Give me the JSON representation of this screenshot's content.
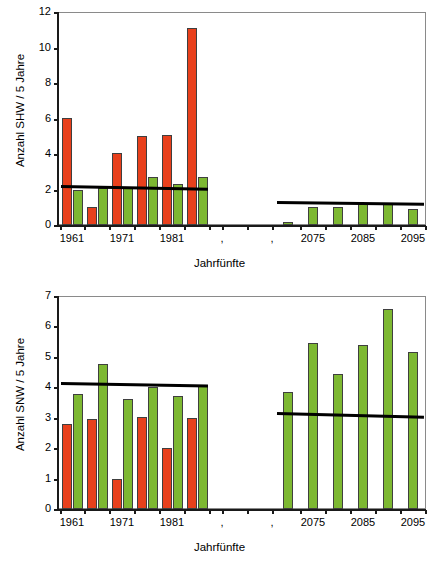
{
  "figure": {
    "width": 439,
    "height": 568,
    "colors": {
      "bar_observed": "#e8401c",
      "bar_modelled": "#7db832",
      "trend_line": "#000000",
      "axis": "#1a1a1a",
      "frame": "#8a8a8a",
      "background": "#ffffff"
    }
  },
  "chart_data": [
    {
      "type": "bar",
      "id": "shw-chart",
      "title": "",
      "xlabel": "Jahrfünfte",
      "ylabel": "Anzahl SHW / 5 Jahre",
      "ylim": [
        0,
        12
      ],
      "yticks": [
        0,
        2,
        4,
        6,
        8,
        10,
        12
      ],
      "ytick_labels": [
        "0",
        "2",
        "4",
        "6",
        "8",
        "10",
        "12"
      ],
      "grid": false,
      "legend": "none",
      "xtick_labels": [
        "1961",
        "1971",
        "1981",
        ",",
        ",",
        "2075",
        "2085",
        "2095"
      ],
      "categories": [
        "1961",
        "1966",
        "1971",
        "1976",
        "1981",
        "1986",
        "2070",
        "2075",
        "2080",
        "2085",
        "2090",
        "2095"
      ],
      "series": [
        {
          "name": "beobachtet",
          "color": "#e8401c",
          "values": [
            6.05,
            1.0,
            4.05,
            5.0,
            5.05,
            11.1,
            null,
            null,
            null,
            null,
            null,
            null
          ]
        },
        {
          "name": "modelliert",
          "color": "#7db832",
          "values": [
            2.0,
            2.1,
            2.15,
            2.7,
            2.3,
            2.7,
            0.15,
            1.0,
            1.0,
            1.2,
            1.25,
            0.9
          ]
        }
      ],
      "trends": [
        {
          "name": "trend-left",
          "x_from": "1961",
          "x_to": "1986",
          "y_from": 2.25,
          "y_to": 2.1
        },
        {
          "name": "trend-right",
          "x_from": "2070",
          "x_to": "2095",
          "y_from": 1.35,
          "y_to": 1.25
        }
      ]
    },
    {
      "type": "bar",
      "id": "snw-chart",
      "title": "",
      "xlabel": "Jahrfünfte",
      "ylabel": "Anzahl SNW / 5 Jahre",
      "ylim": [
        0,
        7
      ],
      "yticks": [
        0,
        1,
        2,
        3,
        4,
        5,
        6,
        7
      ],
      "ytick_labels": [
        "0",
        "1",
        "2",
        "3",
        "4",
        "5",
        "6",
        "7"
      ],
      "grid": false,
      "legend": "none",
      "xtick_labels": [
        "1961",
        "1971",
        "1981",
        ",",
        ",",
        "2075",
        "2085",
        "2095"
      ],
      "categories": [
        "1961",
        "1966",
        "1971",
        "1976",
        "1981",
        "1986",
        "2070",
        "2075",
        "2080",
        "2085",
        "2090",
        "2095"
      ],
      "series": [
        {
          "name": "beobachtet",
          "color": "#e8401c",
          "values": [
            2.78,
            2.95,
            0.97,
            3.02,
            2.02,
            3.0,
            null,
            null,
            null,
            null,
            null,
            null
          ]
        },
        {
          "name": "modelliert",
          "color": "#7db832",
          "values": [
            3.77,
            4.75,
            3.62,
            4.0,
            3.72,
            4.07,
            3.83,
            5.47,
            4.45,
            5.38,
            6.58,
            5.15
          ]
        }
      ],
      "trends": [
        {
          "name": "trend-left",
          "x_from": "1961",
          "x_to": "1986",
          "y_from": 4.18,
          "y_to": 4.1
        },
        {
          "name": "trend-right",
          "x_from": "2070",
          "x_to": "2095",
          "y_from": 3.2,
          "y_to": 3.08
        }
      ]
    }
  ]
}
